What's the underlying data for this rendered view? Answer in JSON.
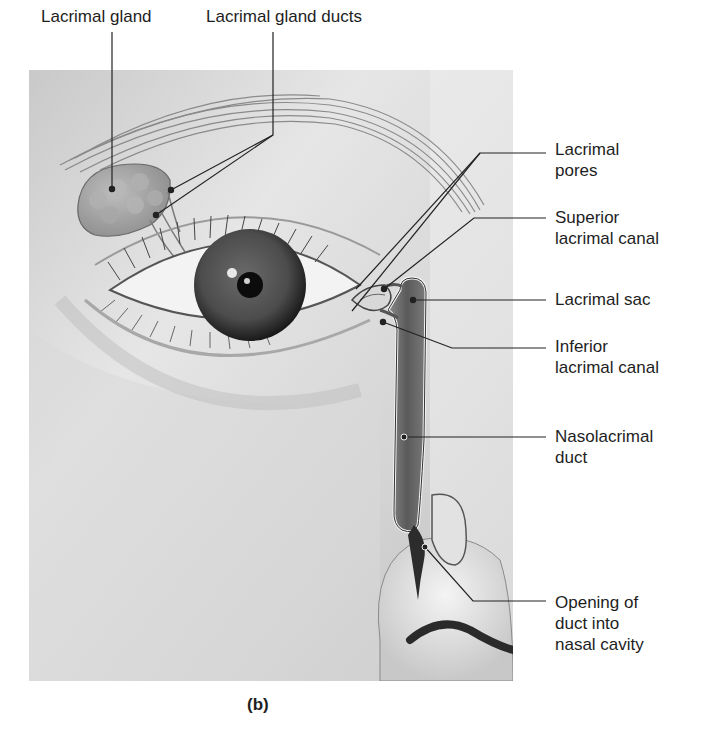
{
  "figure": {
    "panel_label": "(b)",
    "top_labels": [
      {
        "id": "lacrimal-gland",
        "text": "Lacrimal gland"
      },
      {
        "id": "lacrimal-gland-ducts",
        "text": "Lacrimal gland ducts"
      }
    ],
    "right_labels": [
      {
        "id": "lacrimal-pores",
        "lines": [
          "Lacrimal",
          "pores"
        ]
      },
      {
        "id": "superior-lacrimal-canal",
        "lines": [
          "Superior",
          "lacrimal canal"
        ]
      },
      {
        "id": "lacrimal-sac",
        "lines": [
          "Lacrimal sac"
        ]
      },
      {
        "id": "inferior-lacrimal-canal",
        "lines": [
          "Inferior",
          "lacrimal canal"
        ]
      },
      {
        "id": "nasolacrimal-duct",
        "lines": [
          "Nasolacrimal",
          "duct"
        ]
      },
      {
        "id": "opening-of-duct",
        "lines": [
          "Opening of",
          "duct into",
          "nasal cavity"
        ]
      }
    ]
  },
  "colors": {
    "background": "#ffffff",
    "skin_light": "#f2f2f2",
    "skin_mid": "#cfcfcf",
    "skin_dark": "#9a9a9a",
    "iris": "#4a4a4a",
    "pupil": "#0c0c0c",
    "duct": "#6e6e6e",
    "leader": "#222222"
  }
}
